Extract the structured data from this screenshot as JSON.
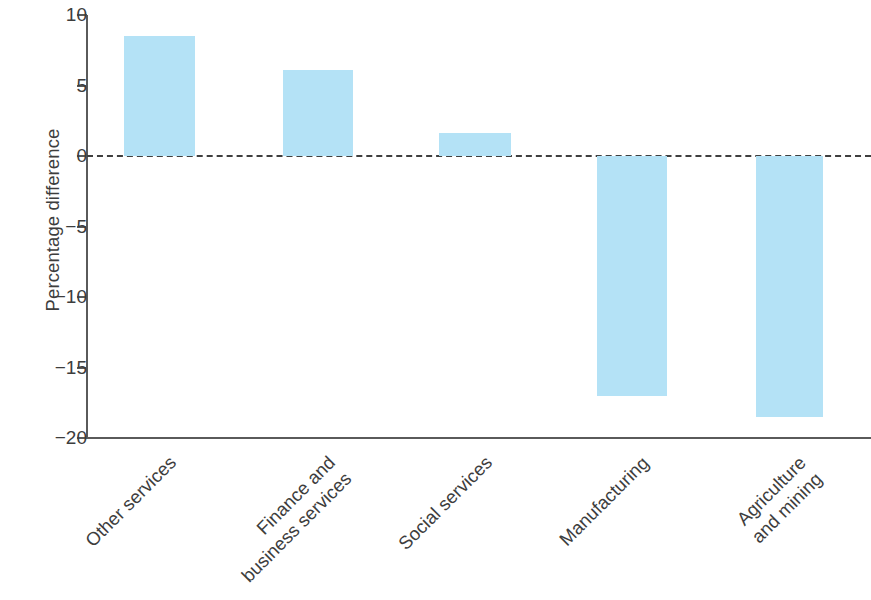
{
  "chart_data": {
    "type": "bar",
    "title": "",
    "subtitle": "",
    "xlabel": "",
    "ylabel": "Percentage difference",
    "categories": [
      "Other services",
      "Finance and business services",
      "Social services",
      "Manufacturing",
      "Agriculture and mining"
    ],
    "category_lines": [
      [
        "Other services",
        ""
      ],
      [
        "Finance and",
        "business services"
      ],
      [
        "Social services",
        ""
      ],
      [
        "Manufacturing",
        ""
      ],
      [
        "Agriculture",
        "and mining"
      ]
    ],
    "values": [
      8.5,
      6.1,
      1.6,
      -17.0,
      -18.5
    ],
    "ylim": [
      -20,
      10
    ],
    "yticks": [
      10,
      5,
      0,
      -5,
      -10,
      -15,
      -20
    ],
    "ytick_labels": [
      "10",
      "5",
      "0",
      "−5",
      "−10",
      "−15",
      "−20"
    ],
    "grid": false,
    "legend": false,
    "legend_position": "none",
    "annotations": [
      {
        "name": "zero-reference-line",
        "value": 0,
        "style": "dashed"
      }
    ],
    "colors": {
      "bar_fill": "#b4e2f6",
      "axis": "#5a5a5a",
      "text": "#3d3d3d",
      "zero_line": "#3f3f3f",
      "background": "#ffffff"
    }
  }
}
